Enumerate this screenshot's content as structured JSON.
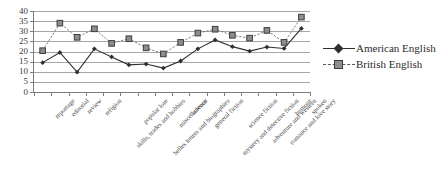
{
  "chart_data": {
    "type": "line",
    "title": "",
    "subtitle": "",
    "xlabel": "",
    "ylabel": "",
    "ylim": [
      0,
      40
    ],
    "y_ticks": [
      0,
      5,
      10,
      15,
      20,
      25,
      30,
      35,
      40
    ],
    "grid": true,
    "legend_position": "right",
    "categories": [
      "reportage",
      "editorial",
      "review",
      "religion",
      "skills, trades and hobbies",
      "popular lore",
      "belles lettres and biographies",
      "miscellaneous",
      "science",
      "general fiction",
      "mystery and detective fiction",
      "science fiction",
      "adventure and western",
      "romance and love story",
      "humour",
      "spoken"
    ],
    "series": [
      {
        "name": "American English",
        "marker": "diamond",
        "line_style": "solid",
        "color": "#2f2f2f",
        "values": [
          14.5,
          19.5,
          9.8,
          21.3,
          17.3,
          13.4,
          13.8,
          11.8,
          15.3,
          21.3,
          25.7,
          22.4,
          20.2,
          22.2,
          21.5,
          31.4
        ]
      },
      {
        "name": "British English",
        "marker": "square",
        "line_style": "dashed",
        "color": "#8d8d8d",
        "values": [
          20.4,
          34.0,
          27.0,
          31.2,
          24.0,
          26.3,
          21.8,
          18.8,
          24.5,
          29.1,
          31.0,
          28.0,
          26.6,
          30.4,
          24.5,
          37.0
        ]
      }
    ]
  },
  "legend": {
    "items": [
      {
        "label": "American English"
      },
      {
        "label": "British English"
      }
    ]
  }
}
